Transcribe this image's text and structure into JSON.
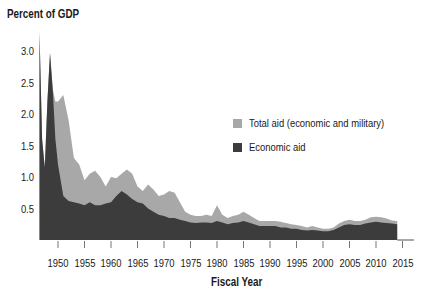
{
  "chart_data": {
    "type": "area",
    "title": "",
    "ylabel": "Percent of GDP",
    "xlabel": "Fiscal Year",
    "ylim": [
      0,
      3.4
    ],
    "xlim": [
      1947,
      2017
    ],
    "grid": false,
    "legend_position": "inside-right",
    "y_ticks": [
      "0.5",
      "1.0",
      "1.5",
      "2.0",
      "2.5",
      "3.0"
    ],
    "x_ticks": [
      "1950",
      "1955",
      "1960",
      "1965",
      "1970",
      "1975",
      "1980",
      "1985",
      "1990",
      "1995",
      "2000",
      "2005",
      "2010",
      "2015"
    ],
    "x": [
      1946.5,
      1947,
      1947.5,
      1948,
      1948.5,
      1949,
      1949.5,
      1950,
      1951,
      1952,
      1953,
      1954,
      1955,
      1956,
      1957,
      1958,
      1959,
      1960,
      1961,
      1962,
      1963,
      1964,
      1965,
      1966,
      1967,
      1968,
      1969,
      1970,
      1971,
      1972,
      1973,
      1974,
      1975,
      1976,
      1977,
      1978,
      1979,
      1980,
      1981,
      1982,
      1983,
      1984,
      1985,
      1986,
      1987,
      1988,
      1989,
      1990,
      1991,
      1992,
      1993,
      1994,
      1995,
      1996,
      1997,
      1998,
      1999,
      2000,
      2001,
      2002,
      2003,
      2004,
      2005,
      2006,
      2007,
      2008,
      2009,
      2010,
      2011,
      2012,
      2013,
      2014
    ],
    "series": [
      {
        "name": "Total aid (economic and military)",
        "color": "#a8a8a8",
        "values": [
          3.3,
          1.6,
          1.15,
          2.2,
          2.97,
          2.4,
          2.2,
          2.2,
          2.3,
          1.9,
          1.3,
          1.2,
          0.95,
          1.05,
          1.1,
          1.0,
          0.85,
          1.0,
          0.98,
          1.05,
          1.12,
          1.05,
          0.85,
          0.78,
          0.88,
          0.8,
          0.7,
          0.72,
          0.78,
          0.75,
          0.6,
          0.45,
          0.4,
          0.38,
          0.38,
          0.4,
          0.38,
          0.55,
          0.4,
          0.35,
          0.38,
          0.4,
          0.45,
          0.4,
          0.35,
          0.3,
          0.3,
          0.3,
          0.3,
          0.29,
          0.27,
          0.25,
          0.24,
          0.22,
          0.2,
          0.22,
          0.2,
          0.18,
          0.18,
          0.2,
          0.26,
          0.3,
          0.32,
          0.3,
          0.3,
          0.32,
          0.36,
          0.37,
          0.36,
          0.34,
          0.31,
          0.3
        ]
      },
      {
        "name": "Economic aid",
        "color": "#3c3c3c",
        "values": [
          3.3,
          1.6,
          1.15,
          2.2,
          2.97,
          2.4,
          1.6,
          1.2,
          0.7,
          0.62,
          0.6,
          0.58,
          0.55,
          0.6,
          0.55,
          0.55,
          0.58,
          0.6,
          0.7,
          0.78,
          0.72,
          0.65,
          0.6,
          0.58,
          0.5,
          0.45,
          0.4,
          0.38,
          0.35,
          0.35,
          0.32,
          0.3,
          0.28,
          0.27,
          0.28,
          0.28,
          0.27,
          0.3,
          0.28,
          0.25,
          0.27,
          0.28,
          0.3,
          0.28,
          0.25,
          0.22,
          0.22,
          0.22,
          0.22,
          0.2,
          0.2,
          0.18,
          0.18,
          0.16,
          0.15,
          0.16,
          0.15,
          0.14,
          0.14,
          0.16,
          0.2,
          0.24,
          0.25,
          0.24,
          0.24,
          0.26,
          0.28,
          0.29,
          0.28,
          0.27,
          0.26,
          0.25
        ]
      }
    ]
  },
  "legend": {
    "items": [
      {
        "label": "Total aid (economic and military)",
        "color": "#a8a8a8"
      },
      {
        "label": "Economic aid",
        "color": "#3c3c3c"
      }
    ]
  },
  "axis": {
    "y_title": "Percent of GDP",
    "x_title": "Fiscal Year"
  }
}
